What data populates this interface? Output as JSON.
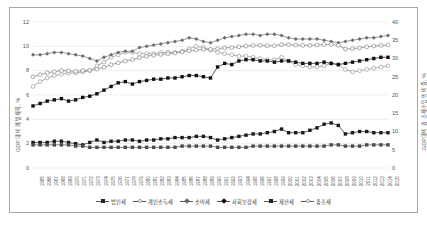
{
  "chart_data": {
    "type": "line",
    "title": "",
    "xlabel": "",
    "ylabel": "GDP 대비 개별세목, %",
    "ylabel_right": "GDP대비 총 조세수입의 비중, %",
    "ylim": [
      0,
      12
    ],
    "ylim_right": [
      0,
      40
    ],
    "yticks": [
      "0",
      "2",
      "4",
      "6",
      "8",
      "10",
      "12"
    ],
    "yticks_right": [
      "0",
      "5",
      "10",
      "15",
      "20",
      "25",
      "30",
      "35",
      "40"
    ],
    "grid": true,
    "legend_position": "bottom",
    "x": [
      "1965",
      "1966",
      "1967",
      "1968",
      "1969",
      "1970",
      "1971",
      "1972",
      "1973",
      "1974",
      "1975",
      "1976",
      "1977",
      "1978",
      "1979",
      "1980",
      "1981",
      "1982",
      "1983",
      "1984",
      "1985",
      "1986",
      "1987",
      "1988",
      "1989",
      "1990",
      "1991",
      "1992",
      "1993",
      "1994",
      "1995",
      "1996",
      "1997",
      "1998",
      "1999",
      "2000",
      "2001",
      "2002",
      "2003",
      "2004",
      "2005",
      "2006",
      "2007",
      "2008",
      "2009",
      "2010",
      "2011",
      "2012",
      "2013",
      "2014",
      "2015"
    ],
    "series": [
      {
        "name": "법인세",
        "axis": "left",
        "marker": "square-filled",
        "color": "#1a1a1a",
        "values": [
          2.1,
          2.1,
          2.1,
          2.2,
          2.2,
          2.1,
          2.0,
          1.9,
          2.1,
          2.3,
          2.1,
          2.2,
          2.2,
          2.3,
          2.3,
          2.2,
          2.3,
          2.3,
          2.4,
          2.4,
          2.5,
          2.5,
          2.5,
          2.6,
          2.6,
          2.5,
          2.3,
          2.4,
          2.5,
          2.6,
          2.7,
          2.8,
          2.8,
          2.9,
          3.0,
          3.2,
          2.9,
          2.9,
          2.9,
          3.1,
          3.3,
          3.6,
          3.7,
          3.5,
          2.8,
          2.9,
          3.0,
          3.0,
          2.9,
          2.9,
          2.9
        ]
      },
      {
        "name": "개인소득세",
        "axis": "left",
        "marker": "circle-open",
        "color": "#8c8c8c",
        "values": [
          6.7,
          7.1,
          7.4,
          7.6,
          7.7,
          7.8,
          7.8,
          7.9,
          8.0,
          8.4,
          8.7,
          9.1,
          9.3,
          9.5,
          9.5,
          9.4,
          9.4,
          9.4,
          9.5,
          9.5,
          9.5,
          9.6,
          9.8,
          10.0,
          9.9,
          9.7,
          9.5,
          9.4,
          9.3,
          9.2,
          9.2,
          9.1,
          9.0,
          8.9,
          8.9,
          9.1,
          8.8,
          8.5,
          8.4,
          8.3,
          8.3,
          8.4,
          8.6,
          8.5,
          8.1,
          7.9,
          8.0,
          8.1,
          8.2,
          8.3,
          8.4
        ]
      },
      {
        "name": "소비세",
        "axis": "left",
        "marker": "diamond-filled",
        "color": "#6e6e6e",
        "values": [
          9.3,
          9.3,
          9.4,
          9.5,
          9.5,
          9.4,
          9.3,
          9.2,
          9.0,
          8.8,
          9.1,
          9.3,
          9.5,
          9.6,
          9.6,
          9.9,
          10.0,
          10.1,
          10.2,
          10.3,
          10.4,
          10.5,
          10.7,
          10.6,
          10.4,
          10.3,
          10.5,
          10.7,
          10.8,
          10.9,
          11.0,
          11.0,
          10.9,
          11.0,
          11.0,
          10.9,
          10.7,
          10.6,
          10.6,
          10.6,
          10.6,
          10.5,
          10.4,
          10.3,
          10.4,
          10.5,
          10.6,
          10.7,
          10.7,
          10.8,
          10.9
        ]
      },
      {
        "name": "사회보장세",
        "axis": "left",
        "marker": "square-filled",
        "color": "#111111",
        "values": [
          5.1,
          5.3,
          5.5,
          5.6,
          5.7,
          5.5,
          5.6,
          5.8,
          5.9,
          6.1,
          6.4,
          6.7,
          7.0,
          7.1,
          6.9,
          7.1,
          7.2,
          7.3,
          7.3,
          7.4,
          7.4,
          7.5,
          7.6,
          7.6,
          7.5,
          7.4,
          8.3,
          8.6,
          8.5,
          8.8,
          8.9,
          8.9,
          8.8,
          8.8,
          8.7,
          8.8,
          8.8,
          8.7,
          8.6,
          8.6,
          8.6,
          8.7,
          8.6,
          8.5,
          8.6,
          8.7,
          8.8,
          8.9,
          9.0,
          9.1,
          9.1
        ]
      },
      {
        "name": "재산세",
        "axis": "left",
        "marker": "square-filled",
        "color": "#4a4a4a",
        "values": [
          1.9,
          1.9,
          1.9,
          1.9,
          1.9,
          1.9,
          1.8,
          1.8,
          1.7,
          1.7,
          1.7,
          1.7,
          1.7,
          1.7,
          1.7,
          1.7,
          1.7,
          1.7,
          1.7,
          1.7,
          1.7,
          1.8,
          1.8,
          1.8,
          1.8,
          1.8,
          1.7,
          1.7,
          1.7,
          1.7,
          1.7,
          1.8,
          1.8,
          1.8,
          1.8,
          1.8,
          1.8,
          1.8,
          1.8,
          1.8,
          1.8,
          1.8,
          1.9,
          1.9,
          1.8,
          1.8,
          1.8,
          1.9,
          1.9,
          1.9,
          1.9
        ]
      },
      {
        "name": "총조세",
        "axis": "right",
        "marker": "circle-open",
        "color": "#777777",
        "values": [
          25.0,
          25.6,
          26.1,
          26.4,
          26.7,
          26.6,
          26.5,
          26.7,
          26.8,
          27.1,
          27.6,
          28.3,
          28.8,
          29.3,
          29.7,
          30.2,
          30.6,
          30.9,
          31.1,
          31.3,
          31.5,
          31.8,
          32.1,
          32.3,
          32.5,
          32.5,
          32.7,
          32.9,
          33.0,
          33.2,
          33.4,
          33.6,
          33.6,
          33.5,
          33.5,
          33.8,
          33.8,
          33.7,
          33.6,
          33.6,
          33.7,
          33.8,
          33.9,
          33.6,
          32.6,
          32.7,
          32.9,
          33.2,
          33.4,
          33.6,
          33.7
        ]
      }
    ]
  },
  "legend": {
    "items": [
      {
        "label": "법인세",
        "marker": "square-filled"
      },
      {
        "label": "개인소득세",
        "marker": "circle-open"
      },
      {
        "label": "소비세",
        "marker": "diamond-filled"
      },
      {
        "label": "사회보장세",
        "marker": "square-filled-dark"
      },
      {
        "label": "재산세",
        "marker": "square-filled-gray"
      },
      {
        "label": "총조세",
        "marker": "circle-open-light"
      }
    ]
  }
}
